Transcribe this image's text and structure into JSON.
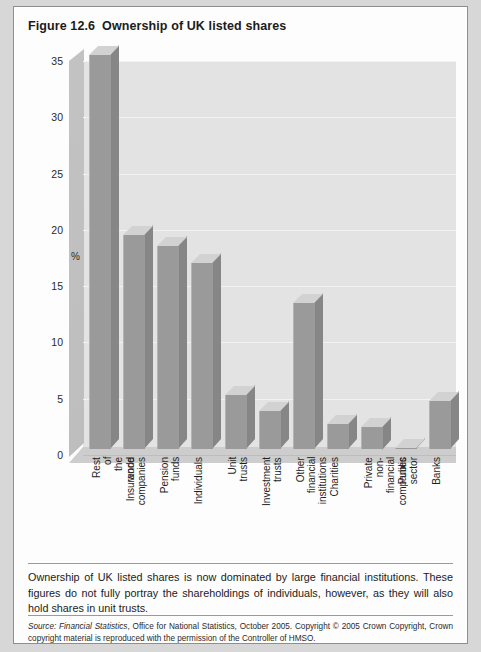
{
  "figure": {
    "number": "Figure 12.6",
    "title": "Ownership of UK listed shares"
  },
  "caption": "Ownership of UK listed shares is now dominated by large financial institutions. These figures do not fully portray the shareholdings of individuals, however, as they will also hold shares in unit trusts.",
  "source": {
    "label": "Source:",
    "publication": "Financial Statistics",
    "rest": ", Office for National Statistics, October 2005. Copyright © 2005 Crown Copyright, Crown copyright material is reproduced with the permission of the Controller of HMSO."
  },
  "colors": {
    "bar_face": "#9a9a9a",
    "bar_side": "#868686",
    "bar_top": "#d2d2d2",
    "plot_background": "#e3e3e3",
    "page_background": "#fdfdfd",
    "gridline": "#f2f2f2"
  },
  "chart_data": {
    "type": "bar",
    "title": "Ownership of UK listed shares",
    "xlabel": "",
    "ylabel": "%",
    "ylim": [
      0,
      35
    ],
    "yticks": [
      0,
      5,
      10,
      15,
      20,
      25,
      30,
      35
    ],
    "grid": true,
    "legend": null,
    "style": "3d-column",
    "categories": [
      "Rest of the world",
      "Insurance companies",
      "Pension funds",
      "Individuals",
      "Unit trusts",
      "Investment trusts",
      "Other financial institutions",
      "Charities",
      "Private non-financial companies",
      "Public sector",
      "Banks"
    ],
    "values": [
      35.0,
      19.0,
      18.0,
      16.5,
      4.8,
      3.4,
      13.0,
      2.2,
      2.0,
      0.1,
      4.3
    ]
  }
}
